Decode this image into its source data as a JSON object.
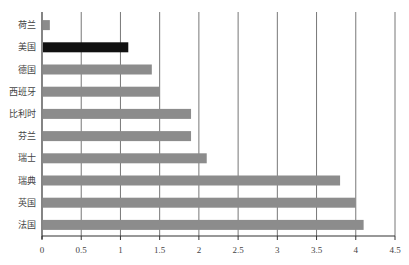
{
  "chart_data": {
    "type": "bar",
    "orientation": "horizontal",
    "title": "",
    "xlabel": "",
    "ylabel": "",
    "categories": [
      "荷兰",
      "美国",
      "德国",
      "西班牙",
      "比利时",
      "芬兰",
      "瑞士",
      "瑞典",
      "英国",
      "法国"
    ],
    "values": [
      0.1,
      1.1,
      1.4,
      1.5,
      1.9,
      1.9,
      2.1,
      3.8,
      4.0,
      4.1
    ],
    "highlight_category": "美国",
    "xlim": [
      0,
      4.5
    ],
    "xticks": [
      0,
      0.5,
      1,
      1.5,
      2,
      2.5,
      3,
      3.5,
      4,
      4.5
    ],
    "xtick_labels": [
      "0",
      "0.5",
      "1",
      "1.5",
      "2",
      "2.5",
      "3",
      "3.5",
      "4",
      "4.5"
    ],
    "grid": "vertical",
    "legend": "none",
    "colors": {
      "bar": "#8c8c8c",
      "highlight_bar": "#111111",
      "grid": "#777777",
      "axis": "#333333"
    }
  }
}
